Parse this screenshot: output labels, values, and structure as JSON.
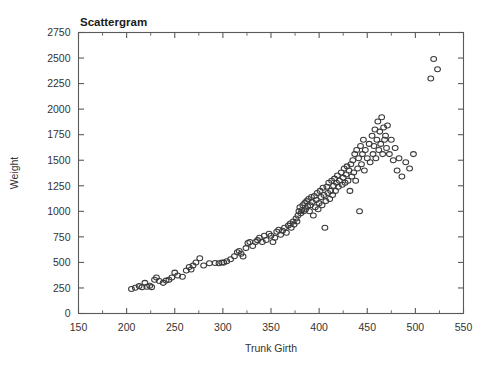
{
  "chart_data": {
    "type": "scatter",
    "title": "Scattergram",
    "xlabel": "Trunk Girth",
    "ylabel": "Weight",
    "xlim": [
      150,
      550
    ],
    "ylim": [
      0,
      2750
    ],
    "grid": false,
    "legend": null,
    "x_major_ticks": [
      150,
      200,
      250,
      300,
      350,
      400,
      450,
      500,
      550
    ],
    "x_minor_interval": 25,
    "y_major_ticks": [
      0,
      250,
      500,
      750,
      1000,
      1250,
      1500,
      1750,
      2000,
      2250,
      2500,
      2750
    ],
    "xtick_labels": [
      "150",
      "200",
      "250",
      "300",
      "350",
      "400",
      "450",
      "500",
      "550"
    ],
    "ytick_labels": [
      "0",
      "250",
      "500",
      "750",
      "1000",
      "1250",
      "1500",
      "1750",
      "2000",
      "2250",
      "2500",
      "2750"
    ],
    "marker": "open-circle",
    "marker_color": "#3a3a3a",
    "n_points": 160,
    "points": [
      [
        205,
        240
      ],
      [
        209,
        252
      ],
      [
        213,
        268
      ],
      [
        216,
        258
      ],
      [
        219,
        300
      ],
      [
        221,
        262
      ],
      [
        224,
        272
      ],
      [
        226,
        258
      ],
      [
        229,
        330
      ],
      [
        231,
        352
      ],
      [
        234,
        318
      ],
      [
        238,
        300
      ],
      [
        241,
        322
      ],
      [
        244,
        330
      ],
      [
        247,
        352
      ],
      [
        250,
        400
      ],
      [
        253,
        372
      ],
      [
        258,
        360
      ],
      [
        262,
        420
      ],
      [
        265,
        455
      ],
      [
        267,
        430
      ],
      [
        269,
        470
      ],
      [
        272,
        500
      ],
      [
        276,
        540
      ],
      [
        280,
        470
      ],
      [
        286,
        492
      ],
      [
        292,
        495
      ],
      [
        296,
        492
      ],
      [
        299,
        500
      ],
      [
        301,
        498
      ],
      [
        304,
        512
      ],
      [
        308,
        530
      ],
      [
        312,
        560
      ],
      [
        315,
        600
      ],
      [
        317,
        612
      ],
      [
        319,
        585
      ],
      [
        321,
        558
      ],
      [
        324,
        640
      ],
      [
        326,
        690
      ],
      [
        328,
        700
      ],
      [
        331,
        660
      ],
      [
        334,
        700
      ],
      [
        336,
        718
      ],
      [
        338,
        742
      ],
      [
        341,
        700
      ],
      [
        343,
        760
      ],
      [
        345,
        720
      ],
      [
        348,
        780
      ],
      [
        350,
        760
      ],
      [
        352,
        700
      ],
      [
        354,
        742
      ],
      [
        356,
        800
      ],
      [
        358,
        820
      ],
      [
        360,
        770
      ],
      [
        362,
        810
      ],
      [
        364,
        840
      ],
      [
        366,
        790
      ],
      [
        368,
        860
      ],
      [
        370,
        880
      ],
      [
        371,
        840
      ],
      [
        373,
        900
      ],
      [
        374,
        870
      ],
      [
        376,
        930
      ],
      [
        377,
        900
      ],
      [
        378,
        960
      ],
      [
        379,
        1000
      ],
      [
        380,
        1040
      ],
      [
        381,
        980
      ],
      [
        382,
        1010
      ],
      [
        383,
        1060
      ],
      [
        384,
        1000
      ],
      [
        385,
        1080
      ],
      [
        386,
        1020
      ],
      [
        387,
        1100
      ],
      [
        388,
        1050
      ],
      [
        389,
        1120
      ],
      [
        390,
        1000
      ],
      [
        391,
        1060
      ],
      [
        392,
        1140
      ],
      [
        393,
        1090
      ],
      [
        394,
        960
      ],
      [
        395,
        1150
      ],
      [
        396,
        1040
      ],
      [
        397,
        1110
      ],
      [
        398,
        1180
      ],
      [
        399,
        1020
      ],
      [
        400,
        1080
      ],
      [
        401,
        1200
      ],
      [
        402,
        1140
      ],
      [
        403,
        1060
      ],
      [
        404,
        1230
      ],
      [
        405,
        1160
      ],
      [
        406,
        840
      ],
      [
        407,
        1100
      ],
      [
        408,
        1240
      ],
      [
        409,
        1180
      ],
      [
        410,
        1280
      ],
      [
        411,
        1120
      ],
      [
        412,
        1200
      ],
      [
        413,
        1300
      ],
      [
        414,
        1160
      ],
      [
        415,
        1250
      ],
      [
        416,
        1320
      ],
      [
        417,
        1200
      ],
      [
        418,
        1280
      ],
      [
        419,
        1350
      ],
      [
        420,
        1240
      ],
      [
        421,
        1300
      ],
      [
        423,
        1380
      ],
      [
        424,
        1260
      ],
      [
        425,
        1330
      ],
      [
        426,
        1420
      ],
      [
        427,
        1280
      ],
      [
        428,
        1360
      ],
      [
        429,
        1440
      ],
      [
        430,
        1300
      ],
      [
        431,
        1400
      ],
      [
        432,
        1200
      ],
      [
        433,
        1460
      ],
      [
        434,
        1340
      ],
      [
        435,
        1500
      ],
      [
        436,
        1380
      ],
      [
        437,
        1560
      ],
      [
        438,
        1300
      ],
      [
        439,
        1600
      ],
      [
        440,
        1420
      ],
      [
        441,
        1520
      ],
      [
        442,
        1000
      ],
      [
        443,
        1640
      ],
      [
        444,
        1460
      ],
      [
        445,
        1560
      ],
      [
        446,
        1700
      ],
      [
        447,
        1400
      ],
      [
        448,
        1600
      ],
      [
        450,
        1520
      ],
      [
        452,
        1660
      ],
      [
        453,
        1480
      ],
      [
        455,
        1740
      ],
      [
        456,
        1560
      ],
      [
        457,
        1640
      ],
      [
        458,
        1800
      ],
      [
        459,
        1520
      ],
      [
        460,
        1700
      ],
      [
        461,
        1880
      ],
      [
        462,
        1600
      ],
      [
        463,
        1780
      ],
      [
        464,
        1660
      ],
      [
        465,
        1920
      ],
      [
        466,
        1560
      ],
      [
        467,
        1820
      ],
      [
        468,
        1700
      ],
      [
        469,
        1740
      ],
      [
        470,
        1620
      ],
      [
        471,
        1840
      ],
      [
        473,
        1560
      ],
      [
        475,
        1700
      ],
      [
        477,
        1500
      ],
      [
        479,
        1620
      ],
      [
        481,
        1400
      ],
      [
        483,
        1520
      ],
      [
        486,
        1340
      ],
      [
        490,
        1480
      ],
      [
        494,
        1420
      ],
      [
        498,
        1560
      ],
      [
        516,
        2300
      ],
      [
        519,
        2490
      ],
      [
        523,
        2390
      ]
    ]
  }
}
